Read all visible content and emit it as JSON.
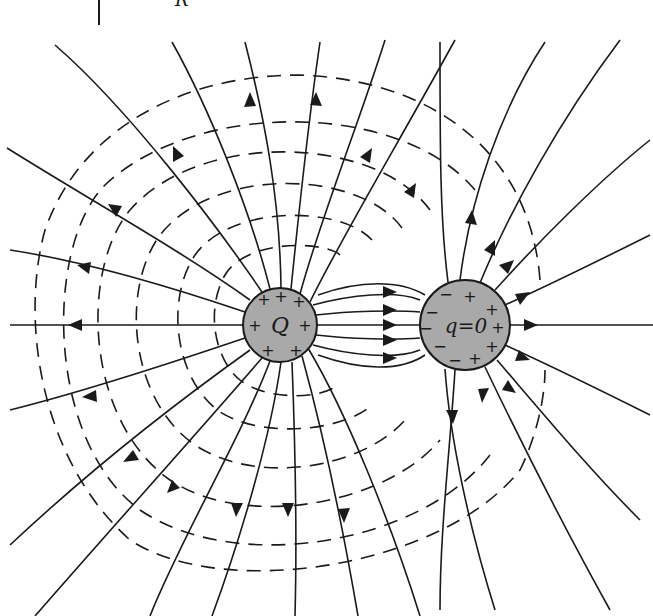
{
  "figure": {
    "top_fragment": {
      "label": "R"
    },
    "charge_Q": {
      "label": "Q",
      "center": [
        280,
        325
      ],
      "radius": 37,
      "fill": "#a9a9a9",
      "surface_signs": [
        "+",
        "+",
        "+",
        "+",
        "+",
        "+",
        "+"
      ]
    },
    "charge_q": {
      "label": "q = 0",
      "label_text": "q=0",
      "center": [
        465,
        325
      ],
      "radius": 45,
      "fill": "#a9a9a9",
      "surface_signs_left": [
        "−",
        "−",
        "−",
        "−",
        "−"
      ],
      "surface_signs_right": [
        "+",
        "+",
        "+",
        "+",
        "+"
      ]
    },
    "legend": {
      "solid_lines": "electric field lines (with direction arrows)",
      "dashed_lines": "equipotential surfaces"
    },
    "counts": {
      "field_lines_from_Q_outward": 16,
      "field_lines_Q_to_q": 5,
      "field_lines_from_q_outward": 9,
      "equipotential_contours": 6
    }
  }
}
